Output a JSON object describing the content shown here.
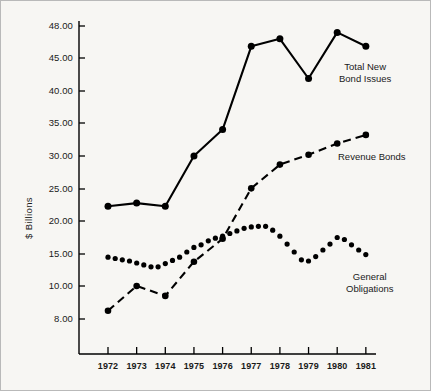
{
  "figure": {
    "background_color": "#f7f6f3",
    "border_color": "#b9b9b9",
    "ink_color": "#000000"
  },
  "axis": {
    "ylabel": "$ Billions",
    "ytick_labels": [
      "48.00",
      "45.00",
      "40.00",
      "35.00",
      "30.00",
      "25.00",
      "20.00",
      "15.00",
      "10.00",
      "8.00"
    ],
    "ytick_values": [
      48,
      45,
      40,
      35,
      30,
      25,
      20,
      15,
      10,
      8
    ],
    "ytick_pixels": [
      25,
      57,
      90,
      122,
      155,
      188,
      220,
      253,
      285,
      318
    ],
    "xtick_labels": [
      "1972",
      "1973",
      "1974",
      "1975",
      "1976",
      "1977",
      "1978",
      "1979",
      "1980",
      "1981"
    ],
    "xlabel": ""
  },
  "annotations": {
    "total_line1": "Total New",
    "total_line2": "Bond Issues",
    "revenue": "Revenue Bonds",
    "general_line1": "General",
    "general_line2": "Obligations"
  },
  "chart_data": {
    "type": "line",
    "title": "",
    "xlabel": "",
    "ylabel": "$ Billions",
    "grid": false,
    "legend": "inline-annotations",
    "x": [
      1972,
      1973,
      1974,
      1975,
      1976,
      1977,
      1978,
      1979,
      1980,
      1981
    ],
    "ylim": [
      8,
      48
    ],
    "ytick_values": [
      48,
      45,
      40,
      35,
      30,
      25,
      20,
      15,
      10,
      8
    ],
    "series": [
      {
        "name": "Total New Bond Issues",
        "style": "solid",
        "marker": "filled-circle",
        "values": [
          22.3,
          22.8,
          22.3,
          30.0,
          34.0,
          46.1,
          46.8,
          41.9,
          47.4,
          46.1
        ]
      },
      {
        "name": "Revenue Bonds",
        "style": "dashed",
        "marker": "filled-circle",
        "values": [
          8.5,
          10.0,
          9.4,
          13.8,
          17.3,
          25.1,
          28.7,
          30.2,
          31.9,
          33.2
        ]
      },
      {
        "name": "General Obligations",
        "style": "dotted",
        "marker": "dots",
        "values": [
          14.5,
          13.9,
          13.0,
          14.5,
          17.0,
          18.5,
          19.2,
          13.9,
          17.5,
          14.9
        ],
        "dense_values": [
          14.5,
          14.3,
          14.1,
          13.9,
          13.6,
          13.3,
          13.0,
          13.0,
          13.5,
          14.0,
          14.5,
          15.3,
          16.0,
          16.4,
          17.0,
          17.4,
          17.7,
          18.1,
          18.5,
          18.9,
          19.1,
          19.2,
          19.2,
          18.6,
          17.7,
          16.5,
          15.3,
          14.1,
          13.9,
          14.6,
          15.6,
          16.5,
          17.5,
          17.2,
          16.4,
          15.6,
          14.9
        ]
      }
    ]
  }
}
